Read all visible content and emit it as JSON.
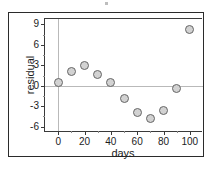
{
  "chart_data": {
    "type": "scatter",
    "title": "",
    "xlabel": "days",
    "ylabel": "residual",
    "xlim": [
      -10,
      110
    ],
    "ylim": [
      -6.8,
      9.8
    ],
    "xticks": [
      0,
      20,
      40,
      60,
      80,
      100
    ],
    "xtick_labels": [
      "0",
      "20",
      "40",
      "60",
      "80",
      "100"
    ],
    "xminor_ticks": [
      10,
      30,
      50,
      70,
      90
    ],
    "yticks": [
      -6,
      -3,
      0,
      3,
      6,
      9
    ],
    "ytick_labels": [
      "-6",
      "-3",
      "0",
      "3",
      "6",
      "9"
    ],
    "yminor_ticks": [
      -4.5,
      -1.5,
      1.5,
      4.5,
      7.5
    ],
    "grid": false,
    "reference_lines": {
      "horizontal": [
        0
      ],
      "vertical": [
        0
      ]
    },
    "legend": null,
    "marker": {
      "shape": "circle",
      "fill_color": "#d2d2d2",
      "edge_color": "#666666",
      "size_px": 9
    },
    "x": [
      0,
      10,
      20,
      30,
      40,
      50,
      60,
      70,
      80,
      90,
      100
    ],
    "y": [
      0.4,
      2.1,
      2.9,
      1.6,
      0.4,
      -1.9,
      -3.9,
      -4.8,
      -3.7,
      -0.4,
      8.3
    ],
    "points": [
      {
        "x": 0,
        "y": 0.4
      },
      {
        "x": 10,
        "y": 2.1
      },
      {
        "x": 20,
        "y": 2.9
      },
      {
        "x": 30,
        "y": 1.6
      },
      {
        "x": 40,
        "y": 0.4
      },
      {
        "x": 50,
        "y": -1.9
      },
      {
        "x": 60,
        "y": -3.9
      },
      {
        "x": 70,
        "y": -4.8
      },
      {
        "x": 80,
        "y": -3.7
      },
      {
        "x": 90,
        "y": -0.4
      },
      {
        "x": 100,
        "y": 8.3
      }
    ]
  },
  "colors": {
    "frame": "#2b2b2b",
    "axis": "#3a3a3a",
    "reference_line": "#b9b9b9",
    "text": "#1c1c1c",
    "background": "#ffffff"
  }
}
